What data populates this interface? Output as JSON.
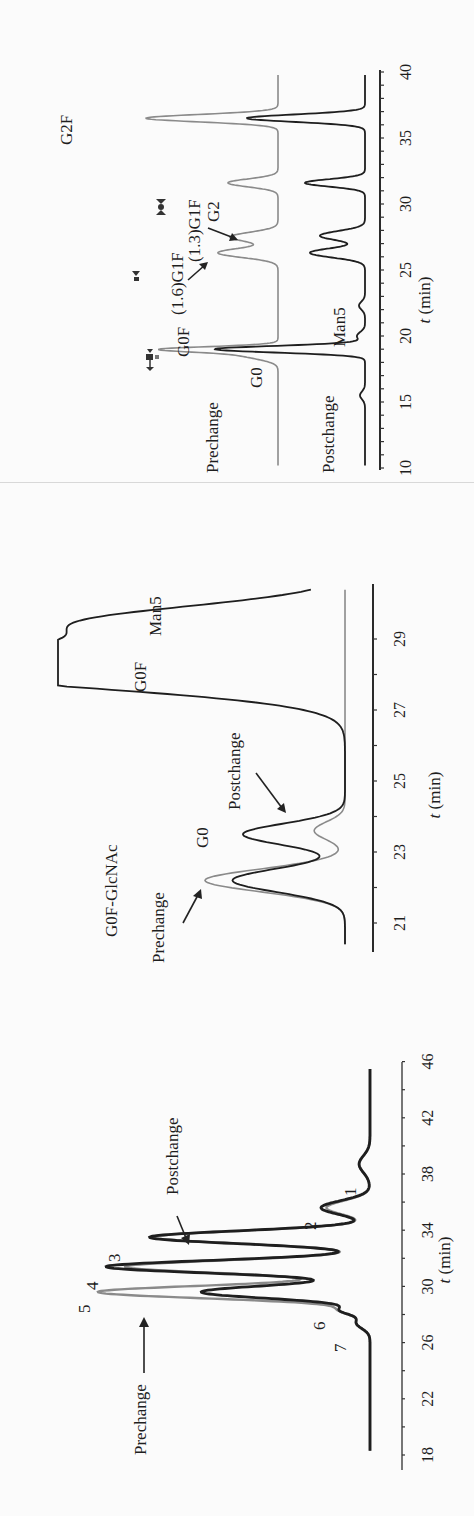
{
  "figure": {
    "orientation": "rotated-90-ccw",
    "colors": {
      "prechange": "#8a8a8a",
      "postchange": "#1e1e1e",
      "axis": "#2a2a2a",
      "text": "#1e1e1e"
    }
  },
  "chart_data": [
    {
      "id": "chart-a",
      "type": "line",
      "title": "",
      "xlabel": "t (min)",
      "ylabel": "",
      "xlim": [
        10,
        40
      ],
      "x_ticks": [
        10,
        15,
        20,
        25,
        30,
        35,
        40
      ],
      "grid": false,
      "series": [
        {
          "name": "Prechange",
          "color": "#8a8a8a",
          "peaks": [
            {
              "label": "G0",
              "t": 18.6,
              "height": 0.36,
              "width": 0.35
            },
            {
              "label": "G0F",
              "t": 19.0,
              "height": 1.0,
              "width": 0.2
            },
            {
              "label": "(1.6)G1F",
              "t": 26.3,
              "height": 0.6,
              "width": 0.35
            },
            {
              "label": "(1.3)G1F",
              "t": 27.5,
              "height": 0.48,
              "width": 0.35
            },
            {
              "label": "G2",
              "t": 31.6,
              "height": 0.5,
              "width": 0.3
            },
            {
              "label": "G2F",
              "t": 36.5,
              "height": 1.32,
              "width": 0.28
            }
          ]
        },
        {
          "name": "Postchange",
          "color": "#1e1e1e",
          "peaks": [
            {
              "label": "",
              "t": 15.5,
              "height": 0.05,
              "width": 0.3
            },
            {
              "label": "G0F",
              "t": 19.0,
              "height": 1.5,
              "width": 0.25
            },
            {
              "label": "Man5",
              "t": 20.0,
              "height": 0.08,
              "width": 0.3
            },
            {
              "label": "",
              "t": 22.3,
              "height": 0.06,
              "width": 0.3
            },
            {
              "label": "(1.6)G1F",
              "t": 26.3,
              "height": 0.55,
              "width": 0.35
            },
            {
              "label": "(1.3)G1F",
              "t": 27.6,
              "height": 0.45,
              "width": 0.35
            },
            {
              "label": "G2",
              "t": 31.6,
              "height": 0.6,
              "width": 0.28
            },
            {
              "label": "G2F",
              "t": 36.5,
              "height": 1.18,
              "width": 0.28
            }
          ]
        }
      ],
      "annotations": [
        "Prechange",
        "Postchange",
        "G0",
        "G0F",
        "(1.6)G1F",
        "(1.3)G1F",
        "G2",
        "G2F",
        "Man5"
      ]
    },
    {
      "id": "chart-b",
      "type": "line",
      "title": "",
      "xlabel": "t (min)",
      "ylabel": "",
      "xlim": [
        20.3,
        30.5
      ],
      "x_ticks": [
        21,
        23,
        25,
        27,
        29
      ],
      "grid": false,
      "series": [
        {
          "name": "Prechange",
          "color": "#8a8a8a",
          "peaks": [
            {
              "label": "G0F-GlcNAc",
              "t": 22.2,
              "height": 1.0,
              "width": 0.32
            },
            {
              "label": "G0",
              "t": 23.6,
              "height": 0.22,
              "width": 0.25
            }
          ]
        },
        {
          "name": "Postchange",
          "color": "#1e1e1e",
          "peaks": [
            {
              "label": "G0F-GlcNAc",
              "t": 22.2,
              "height": 0.75,
              "width": 0.33
            },
            {
              "label": "G0",
              "t": 23.5,
              "height": 0.68,
              "width": 0.3
            },
            {
              "label": "G0F",
              "t": 28.2,
              "height": 3.0,
              "width": 0.55
            },
            {
              "label": "Man5",
              "t": 29.5,
              "height": 1.6,
              "width": 0.45
            }
          ]
        }
      ],
      "annotations": [
        "G0F-GlcNAc",
        "Prechange",
        "G0",
        "Postchange",
        "G0F",
        "Man5"
      ]
    },
    {
      "id": "chart-c",
      "type": "line",
      "title": "",
      "xlabel": "t (min)",
      "ylabel": "",
      "xlim": [
        18,
        47
      ],
      "x_ticks": [
        18,
        22,
        26,
        30,
        34,
        38,
        42,
        46
      ],
      "grid": false,
      "series": [
        {
          "name": "Prechange",
          "color": "#8a8a8a",
          "peaks": [
            {
              "label": "7",
              "t": 27.4,
              "height": 0.05,
              "width": 0.4
            },
            {
              "label": "6",
              "t": 28.3,
              "height": 0.1,
              "width": 0.3
            },
            {
              "label": "5",
              "t": 29.6,
              "height": 1.0,
              "width": 0.45
            },
            {
              "label": "4",
              "t": 31.4,
              "height": 0.9,
              "width": 0.45
            },
            {
              "label": "3",
              "t": 33.5,
              "height": 0.8,
              "width": 0.45
            },
            {
              "label": "2",
              "t": 35.6,
              "height": 0.16,
              "width": 0.5
            },
            {
              "label": "1",
              "t": 38.7,
              "height": 0.04,
              "width": 0.6
            }
          ]
        },
        {
          "name": "Postchange",
          "color": "#1e1e1e",
          "peaks": [
            {
              "label": "7",
              "t": 27.4,
              "height": 0.05,
              "width": 0.4
            },
            {
              "label": "6",
              "t": 28.3,
              "height": 0.1,
              "width": 0.3
            },
            {
              "label": "5",
              "t": 29.6,
              "height": 0.62,
              "width": 0.45
            },
            {
              "label": "4",
              "t": 31.4,
              "height": 0.97,
              "width": 0.45
            },
            {
              "label": "3",
              "t": 33.5,
              "height": 0.81,
              "width": 0.45
            },
            {
              "label": "2",
              "t": 35.6,
              "height": 0.18,
              "width": 0.5
            },
            {
              "label": "1",
              "t": 38.7,
              "height": 0.04,
              "width": 0.6
            }
          ]
        }
      ],
      "annotations": [
        "Prechange",
        "Postchange",
        "1",
        "2",
        "3",
        "4",
        "5",
        "6",
        "7"
      ]
    }
  ],
  "charts": {
    "a": {
      "xlabel": "t (min)",
      "ticks": [
        "10",
        "15",
        "20",
        "25",
        "30",
        "35",
        "40"
      ],
      "labels": {
        "prechange": "Prechange",
        "postchange": "Postchange",
        "g0": "G0",
        "g0f": "G0F",
        "g16g1f": "(1.6)G1F",
        "g13g1f": "(1.3)G1F",
        "g2": "G2",
        "g2f": "G2F",
        "man5": "Man5"
      }
    },
    "b": {
      "xlabel": "t (min)",
      "ticks": [
        "21",
        "23",
        "25",
        "27",
        "29"
      ],
      "labels": {
        "g0fglcnac": "G0F-GlcNAc",
        "prechange": "Prechange",
        "g0": "G0",
        "postchange": "Postchange",
        "g0f": "G0F",
        "man5": "Man5"
      }
    },
    "c": {
      "xlabel": "t (min)",
      "ticks": [
        "18",
        "22",
        "26",
        "30",
        "34",
        "38",
        "42",
        "46"
      ],
      "labels": {
        "prechange": "Prechange",
        "postchange": "Postchange",
        "p1": "1",
        "p2": "2",
        "p3": "3",
        "p4": "4",
        "p5": "5",
        "p6": "6",
        "p7": "7"
      }
    }
  }
}
